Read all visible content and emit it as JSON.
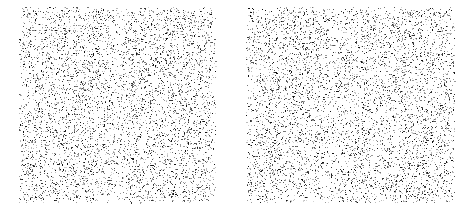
{
  "figure": {
    "title": "",
    "subtitle": "",
    "background_color": "#ffffff",
    "width": 471,
    "height": 218,
    "panel_count": 2,
    "caption": ""
  },
  "chart_data": {
    "type": "scatter",
    "title": "",
    "subtitle": "",
    "xlabel": "",
    "ylabel": "",
    "grid": false,
    "legend": null,
    "legend_position": "none",
    "axes_visible": false,
    "tick_labels_x": [],
    "tick_labels_y": [],
    "background_color": "#ffffff",
    "marker": {
      "shape": "square",
      "size_px": 1,
      "colors": [
        "#111111",
        "#333333",
        "#555555",
        "#777777",
        "#999999",
        "#bbbbbb",
        "#d4d4d4"
      ],
      "color_weights": [
        0.08,
        0.12,
        0.15,
        0.18,
        0.19,
        0.16,
        0.12
      ]
    },
    "panels": [
      {
        "name": "left-panel",
        "label": "",
        "x_px": 19,
        "y_px": 7,
        "width_px": 198,
        "height_px": 197,
        "xlim": [
          0,
          1
        ],
        "ylim": [
          0,
          1
        ],
        "point_count": 5200,
        "seed": 12345,
        "density_description": "uniform random speckle with faint vertical lighter band near x=0.50 and slightly lighter margins",
        "band_center": 0.505,
        "band_width": 0.05,
        "band_density_factor": 0.55
      },
      {
        "name": "right-panel",
        "label": "",
        "x_px": 246,
        "y_px": 7,
        "width_px": 210,
        "height_px": 197,
        "xlim": [
          0,
          1
        ],
        "ylim": [
          0,
          1
        ],
        "point_count": 5500,
        "seed": 67890,
        "density_description": "uniform random speckle with faint vertical lighter band near x=0.42 and slightly lighter margins",
        "band_center": 0.42,
        "band_width": 0.05,
        "band_density_factor": 0.55
      }
    ]
  }
}
